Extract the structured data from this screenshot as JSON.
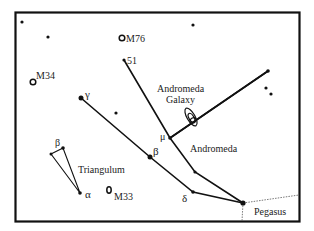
{
  "chart": {
    "frame": {
      "x": 15,
      "y": 12,
      "w": 285,
      "h": 210,
      "stroke": "#111111"
    },
    "colors": {
      "ink": "#111111",
      "boundary": "#555555"
    }
  },
  "labels": {
    "m76": "M76",
    "m34": "M34",
    "m33": "M33",
    "star51": "51",
    "gamma": "γ",
    "beta_and": "β",
    "mu": "μ",
    "delta": "δ",
    "beta_tri": "β",
    "alpha_tri": "α",
    "andromeda_galaxy_line1": "Andromeda",
    "andromeda_galaxy_line2": "Galaxy",
    "andromeda": "Andromeda",
    "triangulum": "Triangulum",
    "pegasus": "Pegasus"
  },
  "stars": [
    {
      "id": "lone-1",
      "x": 22,
      "y": 22,
      "r": 1.6
    },
    {
      "id": "lone-2",
      "x": 48,
      "y": 37,
      "r": 1.6
    },
    {
      "id": "lone-3",
      "x": 193,
      "y": 25,
      "r": 1.6
    },
    {
      "id": "lone-4",
      "x": 116,
      "y": 113,
      "r": 1.6
    },
    {
      "id": "star-51",
      "x": 124,
      "y": 60,
      "r": 1.6
    },
    {
      "id": "gamma-and",
      "x": 81,
      "y": 98,
      "r": 2.5
    },
    {
      "id": "beta-and",
      "x": 150,
      "y": 157,
      "r": 2.5
    },
    {
      "id": "mu-and",
      "x": 170,
      "y": 138,
      "r": 1.8
    },
    {
      "id": "nu-and",
      "x": 195,
      "y": 172,
      "r": 1.6
    },
    {
      "id": "delta-and",
      "x": 193,
      "y": 192,
      "r": 1.8
    },
    {
      "id": "alpha-and",
      "x": 243,
      "y": 203,
      "r": 2.6
    },
    {
      "id": "right-star",
      "x": 268,
      "y": 71,
      "r": 1.8
    },
    {
      "id": "right-pair-1",
      "x": 266,
      "y": 88,
      "r": 1.6
    },
    {
      "id": "right-pair-2",
      "x": 271,
      "y": 94,
      "r": 1.6
    },
    {
      "id": "beta-tri",
      "x": 63,
      "y": 148,
      "r": 1.8
    },
    {
      "id": "gamma-tri",
      "x": 51,
      "y": 154,
      "r": 1.5
    },
    {
      "id": "alpha-tri",
      "x": 80,
      "y": 193,
      "r": 1.8
    }
  ],
  "deep_sky": [
    {
      "id": "m76",
      "x": 122,
      "y": 38
    },
    {
      "id": "m34",
      "x": 33,
      "y": 82
    },
    {
      "id": "m33",
      "x": 109,
      "y": 190
    }
  ]
}
